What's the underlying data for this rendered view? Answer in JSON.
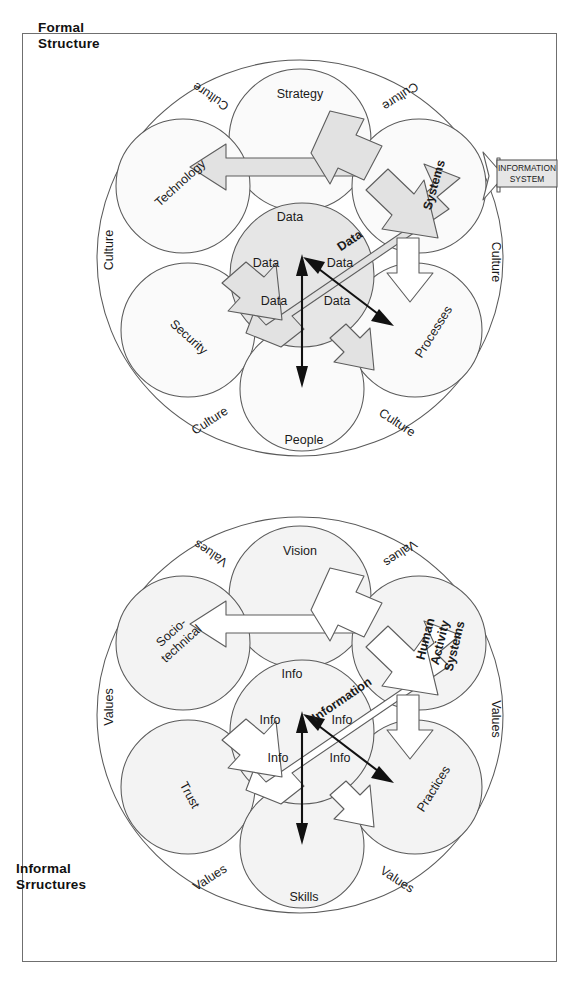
{
  "page": {
    "width": 588,
    "height": 989,
    "background": "#ffffff",
    "frame_border_color": "#6f6f6f"
  },
  "colors": {
    "shaded_bubble": "#f2f2f2",
    "center_bubble": "#e8e8e8",
    "arrow_fill_top": "#e2e2e2",
    "arrow_fill_bottom": "#ffffff",
    "outline": "#5a5a5a",
    "text": "#1a1a1a"
  },
  "top_diagram": {
    "corner_label": "Formal\nStructure",
    "corner_label_line1": "Formal",
    "corner_label_line2": "Structure",
    "outer_ring_labels": [
      {
        "text": "Culture",
        "position": "top-left"
      },
      {
        "text": "Culture",
        "position": "top-right"
      },
      {
        "text": "Culture",
        "position": "left"
      },
      {
        "text": "Culture",
        "position": "right"
      },
      {
        "text": "Culture",
        "position": "bottom-left"
      },
      {
        "text": "Culture",
        "position": "bottom-right"
      }
    ],
    "bubbles": [
      {
        "label": "Strategy",
        "position": "top"
      },
      {
        "label": "Technology",
        "position": "upper-left"
      },
      {
        "label": "Security",
        "position": "lower-left"
      },
      {
        "label": "People",
        "position": "bottom"
      },
      {
        "label": "Processes",
        "position": "lower-right"
      }
    ],
    "big_label": "Systems",
    "center_bubble_labels": [
      "Data",
      "Data",
      "Data",
      "Data",
      "Data",
      "Data"
    ],
    "main_arrow_label": "Data",
    "callout": {
      "line1": "INFORMATION",
      "line2": "SYSTEM"
    }
  },
  "bottom_diagram": {
    "corner_label_line1": "Informal",
    "corner_label_line2": "Srructures",
    "outer_ring_labels": [
      {
        "text": "Values",
        "position": "top-left"
      },
      {
        "text": "Values",
        "position": "top-right"
      },
      {
        "text": "Values",
        "position": "left"
      },
      {
        "text": "Values",
        "position": "right"
      },
      {
        "text": "Values",
        "position": "bottom-left"
      },
      {
        "text": "Values",
        "position": "bottom-right"
      }
    ],
    "bubbles": [
      {
        "label": "Vision",
        "position": "top"
      },
      {
        "label": "Socio-",
        "label2": "technical",
        "position": "upper-left"
      },
      {
        "label": "Trust",
        "position": "lower-left"
      },
      {
        "label": "Skills",
        "position": "bottom"
      },
      {
        "label": "Practices",
        "position": "lower-right"
      }
    ],
    "big_label_line1": "Human",
    "big_label_line2": "Activity",
    "big_label_line3": "Systems",
    "center_bubble_labels": [
      "Info",
      "Info",
      "Info",
      "Info",
      "Info",
      "Info"
    ],
    "main_arrow_label": "Information"
  }
}
